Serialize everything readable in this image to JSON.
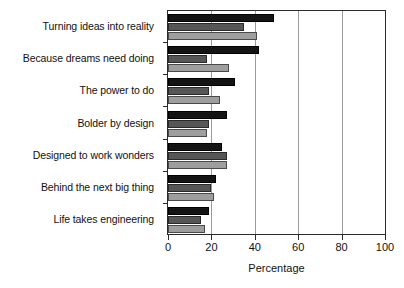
{
  "chart_data": {
    "type": "bar",
    "orientation": "horizontal",
    "title": "",
    "xlabel": "Percentage",
    "ylabel": "",
    "xlim": [
      0,
      100
    ],
    "xticks": [
      0,
      20,
      40,
      60,
      80,
      100
    ],
    "grid": true,
    "legend": "none",
    "categories": [
      "Turning ideas into reality",
      "Because dreams need doing",
      "The power to do",
      "Bolder by design",
      "Designed to work wonders",
      "Behind the next big thing",
      "Life takes engineering"
    ],
    "series": [
      {
        "name": "Series 1",
        "color": "#141414",
        "values": [
          49,
          42,
          31,
          27,
          25,
          22,
          19
        ]
      },
      {
        "name": "Series 2",
        "color": "#565656",
        "values": [
          35,
          18,
          19,
          19,
          27,
          20,
          15
        ]
      },
      {
        "name": "Series 3",
        "color": "#9e9e9e",
        "values": [
          41,
          28,
          24,
          18,
          27,
          21,
          17
        ]
      }
    ]
  },
  "axis": {
    "x_title": "Percentage",
    "tick_labels": [
      "0",
      "20",
      "40",
      "60",
      "80",
      "100"
    ]
  },
  "categories_labels": [
    "Turning ideas into reality",
    "Because dreams need doing",
    "The power to do",
    "Bolder by design",
    "Designed to work wonders",
    "Behind the next big thing",
    "Life takes engineering"
  ]
}
